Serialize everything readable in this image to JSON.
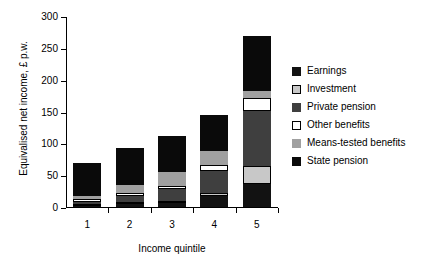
{
  "chart_data": {
    "type": "bar",
    "stacked": true,
    "title": "",
    "xlabel": "Income quintile",
    "ylabel": "Equivalised net income, £ p.w.",
    "categories": [
      "1",
      "2",
      "3",
      "4",
      "5"
    ],
    "ylim": [
      0,
      300
    ],
    "yticks": [
      0,
      50,
      100,
      150,
      200,
      250,
      300
    ],
    "grid": false,
    "legend_position": "right",
    "series": [
      {
        "name": "Earnings",
        "color": "#121212",
        "values": [
          2,
          4,
          6,
          17,
          36
        ]
      },
      {
        "name": "Investment",
        "color": "#c8c8c8",
        "values": [
          2,
          2,
          4,
          5,
          28
        ]
      },
      {
        "name": "Private pension",
        "color": "#3f3f3f",
        "values": [
          3,
          10,
          18,
          34,
          87
        ]
      },
      {
        "name": "Other benefits",
        "color": "#ffffff",
        "values": [
          4,
          5,
          5,
          10,
          21
        ]
      },
      {
        "name": "Means-tested benefits",
        "color": "#a0a0a0",
        "values": [
          5,
          12,
          22,
          22,
          11
        ]
      },
      {
        "name": "State pension",
        "color": "#0a0a0a",
        "values": [
          52,
          58,
          57,
          57,
          85
        ]
      }
    ],
    "totals": [
      68,
      91,
      112,
      145,
      268
    ]
  },
  "legend": {
    "items": [
      {
        "label": "Earnings",
        "swatch": "sw-earnings"
      },
      {
        "label": "Investment",
        "swatch": "sw-investment"
      },
      {
        "label": "Private pension",
        "swatch": "sw-private"
      },
      {
        "label": "Other benefits",
        "swatch": "sw-other"
      },
      {
        "label": "Means-tested benefits",
        "swatch": "sw-means"
      },
      {
        "label": "State pension",
        "swatch": "sw-state"
      }
    ]
  }
}
